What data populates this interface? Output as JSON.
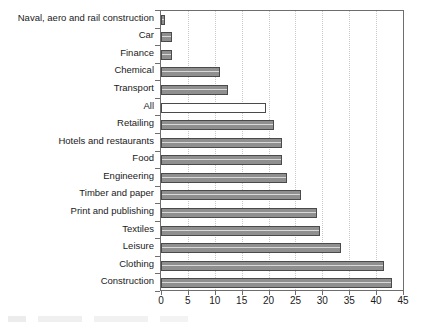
{
  "chart_data": {
    "type": "bar",
    "orientation": "horizontal",
    "title": "",
    "subtitle": "",
    "xlabel": "",
    "ylabel": "",
    "xlim": [
      0,
      45
    ],
    "xticks": [
      0,
      5,
      10,
      15,
      20,
      25,
      30,
      35,
      40,
      45
    ],
    "xtick_labels": [
      "0",
      "5",
      "10",
      "15",
      "20",
      "25",
      "30",
      "35",
      "40",
      "45"
    ],
    "grid": "vertical-dotted",
    "legend": "none",
    "categories": [
      "Naval, aero and rail construction",
      "Car",
      "Finance",
      "Chemical",
      "Transport",
      "All",
      "Retailing",
      "Hotels and restaurants",
      "Food",
      "Engineering",
      "Timber and paper",
      "Print and publishing",
      "Textiles",
      "Leisure",
      "Clothing",
      "Construction"
    ],
    "values": [
      0.7,
      2.0,
      2.0,
      11.0,
      12.5,
      19.5,
      21.0,
      22.5,
      22.5,
      23.5,
      26.0,
      29.0,
      29.5,
      33.5,
      41.5,
      43.0
    ],
    "highlight_category": "All",
    "bar_style": {
      "fill": "#8f8f8f",
      "edge": "#4a4a4a",
      "highlight_fill": "#ffffff"
    }
  }
}
